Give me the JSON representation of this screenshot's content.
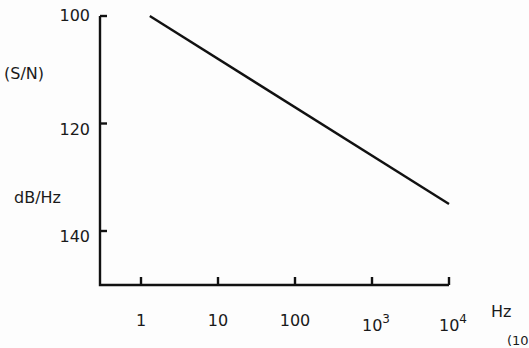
{
  "chart_data": {
    "type": "line",
    "title": "",
    "ylabel": "(S/N) dB/Hz",
    "ylabel_lines": [
      "(S/N)",
      "dB/Hz"
    ],
    "xlabel": "Hz",
    "x_scale": "log",
    "y_inverted": true,
    "xlim": [
      1,
      10000
    ],
    "ylim": [
      100,
      140
    ],
    "x_ticks": [
      {
        "value": 1,
        "label": "1"
      },
      {
        "value": 10,
        "label": "10"
      },
      {
        "value": 100,
        "label": "100"
      },
      {
        "value": 1000,
        "label": "10",
        "sup": "3"
      },
      {
        "value": 10000,
        "label": "10",
        "sup": "4"
      }
    ],
    "y_ticks": [
      {
        "value": 100,
        "label": "100"
      },
      {
        "value": 120,
        "label": "120"
      },
      {
        "value": 140,
        "label": "140"
      }
    ],
    "grid": false,
    "legend": null,
    "series": [
      {
        "name": "S/N",
        "x": [
          1.3,
          10000
        ],
        "y": [
          100,
          135
        ]
      }
    ],
    "annotations": [
      "(10"
    ]
  }
}
